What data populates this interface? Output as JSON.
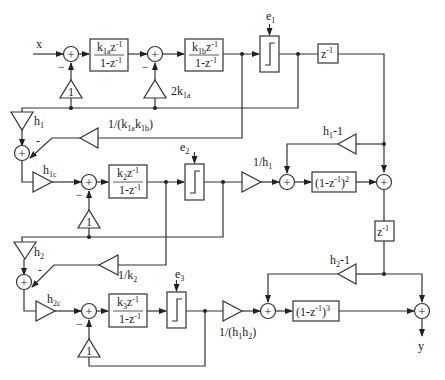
{
  "diagram": {
    "type": "block-diagram",
    "title": "",
    "input_label": "x",
    "output_label": "y",
    "stage1": {
      "integrator_a": {
        "num": "k",
        "num_sub": "1a",
        "num_tail": "z",
        "num_sup": "-1",
        "den": "1-z",
        "den_sup": "-1"
      },
      "integrator_b": {
        "num": "k",
        "num_sub": "1b",
        "num_tail": "z",
        "num_sup": "-1",
        "den": "1-z",
        "den_sup": "-1"
      },
      "feedback_gain_a": "1",
      "feedback_gain_b": {
        "text": "2k",
        "sub": "1a"
      },
      "quantizer_error": {
        "text": "e",
        "sub": "1"
      },
      "delay": {
        "text": "z",
        "sup": "-1"
      },
      "minus_a": "−",
      "minus_b": "−"
    },
    "interstage1": {
      "gain_h1": {
        "text": "h",
        "sub": "1"
      },
      "gain_inv_k": {
        "pre": "1/(k",
        "sub1": "1a",
        "mid": "k",
        "sub2": "1b",
        "post": ")"
      },
      "minus": "-",
      "gain_h1c": {
        "text": "h",
        "sub": "1c"
      }
    },
    "stage2": {
      "integrator": {
        "num": "k",
        "num_sub": "2",
        "num_tail": "z",
        "num_sup": "-1",
        "den": "1-z",
        "den_sup": "-1"
      },
      "feedback_gain": "1",
      "minus": "−",
      "quantizer_error": {
        "text": "e",
        "sub": "2"
      }
    },
    "combiner1": {
      "gain_inv_h1": {
        "text": "1/h",
        "sub": "1"
      },
      "diff_filter": {
        "text": "(1-z",
        "sup": "-1",
        "post": ")",
        "pow": "2"
      },
      "gain_h1_minus1": {
        "text": "h",
        "sub": "1",
        "post": "-1"
      },
      "delay": {
        "text": "z",
        "sup": "-1"
      }
    },
    "interstage2": {
      "gain_h2": {
        "text": "h",
        "sub": "2"
      },
      "gain_inv_k2": {
        "text": "1/k",
        "sub": "2"
      },
      "minus": "-",
      "gain_h2c": {
        "text": "h",
        "sub": "2c"
      }
    },
    "stage3": {
      "integrator": {
        "num": "k",
        "num_sub": "3",
        "num_tail": "z",
        "num_sup": "-1",
        "den": "1-z",
        "den_sup": "-1"
      },
      "feedback_gain": "1",
      "minus": "−",
      "quantizer_error": {
        "text": "e",
        "sub": "3"
      }
    },
    "combiner2": {
      "gain_inv_h1h2": {
        "pre": "1/(h",
        "sub1": "1",
        "mid": "h",
        "sub2": "2",
        "post": ")"
      },
      "diff_filter": {
        "text": "(1-z",
        "sup": "-1",
        "post": ")",
        "pow": "3"
      },
      "gain_h2_minus1": {
        "text": "h",
        "sub": "2",
        "post": "-1"
      }
    },
    "summer_symbol": "+"
  }
}
